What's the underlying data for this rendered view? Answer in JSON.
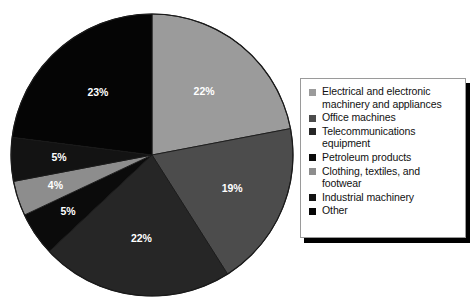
{
  "chart_data": {
    "type": "pie",
    "title": "",
    "subtitle": "",
    "xlabel": "",
    "ylabel": "",
    "legend_position": "right",
    "grid": false,
    "start_angle_deg": 0,
    "direction": "clockwise",
    "categories": [
      "Electrical and electronic machinery and appliances",
      "Office machines",
      "Telecommunications equipment",
      "Petroleum products",
      "Clothing, textiles, and footwear",
      "Industrial machinery",
      "Other"
    ],
    "values": [
      22,
      19,
      22,
      5,
      4,
      5,
      23
    ],
    "value_labels": [
      "22%",
      "19%",
      "22%",
      "5%",
      "4%",
      "5%",
      "23%"
    ],
    "unit": "%",
    "total": 100,
    "colors": [
      "#9b9b9b",
      "#4c4c4c",
      "#262626",
      "#0b0b0b",
      "#8d8d8d",
      "#131313",
      "#050505"
    ]
  },
  "pie": {
    "center_x": 143,
    "center_y": 143,
    "radius": 141,
    "outline_color": "#1a1a1a",
    "label_color": "#ffffff",
    "slices": [
      {
        "label": "22%",
        "value": 22,
        "color": "#9b9b9b",
        "name": "Electrical and electronic machinery and appliances"
      },
      {
        "label": "19%",
        "value": 19,
        "color": "#4c4c4c",
        "name": "Office machines"
      },
      {
        "label": "22%",
        "value": 22,
        "color": "#262626",
        "name": "Telecommunications equipment"
      },
      {
        "label": "5%",
        "value": 5,
        "color": "#0b0b0b",
        "name": "Petroleum products"
      },
      {
        "label": "4%",
        "value": 4,
        "color": "#8d8d8d",
        "name": "Clothing, textiles, and footwear"
      },
      {
        "label": "5%",
        "value": 5,
        "color": "#131313",
        "name": "Industrial machinery"
      },
      {
        "label": "23%",
        "value": 23,
        "color": "#050505",
        "name": "Other"
      }
    ]
  },
  "legend": {
    "border_color": "#9a9a9a",
    "shadow_color": "#000000",
    "background": "#ffffff",
    "items": [
      {
        "label": "Electrical and electronic\nmachinery and appliances",
        "color": "#9b9b9b"
      },
      {
        "label": "Office machines",
        "color": "#4c4c4c"
      },
      {
        "label": "Telecommunications\nequipment",
        "color": "#262626"
      },
      {
        "label": "Petroleum products",
        "color": "#0b0b0b"
      },
      {
        "label": "Clothing, textiles, and\nfootwear",
        "color": "#8d8d8d"
      },
      {
        "label": "Industrial machinery",
        "color": "#131313"
      },
      {
        "label": "Other",
        "color": "#050505"
      }
    ]
  }
}
